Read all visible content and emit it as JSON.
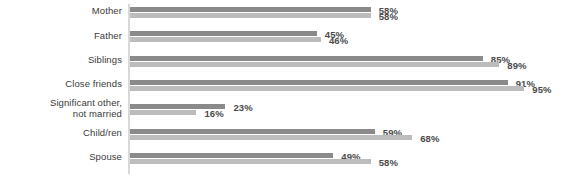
{
  "chart_data": {
    "type": "bar",
    "orientation": "horizontal",
    "title": "",
    "subtitle": "",
    "xlabel": "",
    "ylabel": "",
    "xlim": [
      0,
      100
    ],
    "grid": false,
    "legend": null,
    "value_suffix": "%",
    "categories": [
      "Mother",
      "Father",
      "Siblings",
      "Close friends",
      "Significant other, not married",
      "Child/ren",
      "Spouse"
    ],
    "category_lines": [
      [
        "Mother"
      ],
      [
        "Father"
      ],
      [
        "Siblings"
      ],
      [
        "Close friends"
      ],
      [
        "Significant other,",
        "not married"
      ],
      [
        "Child/ren"
      ],
      [
        "Spouse"
      ]
    ],
    "series": [
      {
        "name": "series-1",
        "color": "#8a8a8a",
        "values": [
          58,
          45,
          85,
          91,
          23,
          59,
          49
        ],
        "labels": [
          "58%",
          "45%",
          "85%",
          "91%",
          "23%",
          "59%",
          "49%"
        ]
      },
      {
        "name": "series-2",
        "color": "#bcbcbc",
        "values": [
          58,
          46,
          89,
          95,
          16,
          68,
          58
        ],
        "labels": [
          "58%",
          "46%",
          "89%",
          "95%",
          "16%",
          "68%",
          "58%"
        ]
      }
    ]
  },
  "style": {
    "axis_color": "#d8d8d8",
    "label_color": "#3a3a3a",
    "value_color": "#4a4a4a",
    "background": "#ffffff"
  }
}
